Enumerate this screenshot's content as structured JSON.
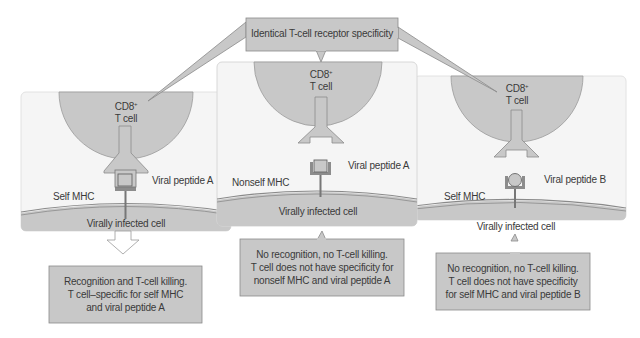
{
  "header": {
    "label": "Identical T-cell receptor specificity"
  },
  "colors": {
    "panel_bg": "#f5f5f5",
    "cell_fill": "#c8c8c8",
    "cell_stroke": "#9a9a9a",
    "box_fill": "#c8c8c8",
    "box_stroke": "#8a8a8a",
    "mhc_fill": "#8c8c8c",
    "text": "#3a3a3a"
  },
  "panels": [
    {
      "tcell_label_line1": "CD8",
      "tcell_label_sup": "+",
      "tcell_label_line2": "T cell",
      "mhc_label": "Self MHC",
      "peptide_label": "Viral peptide A",
      "cell_label": "Virally infected cell",
      "result": {
        "line1": "Recognition and T-cell killing.",
        "line2": "T cell–specific for self MHC",
        "line3": "and viral peptide A"
      }
    },
    {
      "tcell_label_line1": "CD8",
      "tcell_label_sup": "+",
      "tcell_label_line2": "T cell",
      "mhc_label": "Nonself MHC",
      "peptide_label": "Viral peptide A",
      "cell_label": "Virally infected cell",
      "result": {
        "line1": "No recognition, no T-cell killing.",
        "line2": "T cell does not have specificity for",
        "line3": "nonself MHC and viral peptide A"
      }
    },
    {
      "tcell_label_line1": "CD8",
      "tcell_label_sup": "+",
      "tcell_label_line2": "T cell",
      "mhc_label": "Self MHC",
      "peptide_label": "Viral peptide B",
      "cell_label": "Virally infected cell",
      "result": {
        "line1": "No recognition, no T-cell killing.",
        "line2": "T cell does not have specificity",
        "line3": "for self MHC and viral peptide B"
      }
    }
  ]
}
